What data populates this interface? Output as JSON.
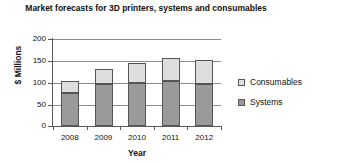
{
  "chart_data": {
    "type": "bar",
    "subtype": "stacked-bar",
    "title": "Market forecasts for 3D printers, systems and consumables",
    "xlabel": "Year",
    "ylabel": "$ Millions",
    "categories": [
      "2008",
      "2009",
      "2010",
      "2011",
      "2012"
    ],
    "series": [
      {
        "name": "Systems",
        "values": [
          77,
          96,
          99,
          103,
          96
        ],
        "color": "#9a9a9a"
      },
      {
        "name": "Consumables",
        "values": [
          26,
          36,
          45,
          54,
          56
        ],
        "color": "#dedede"
      }
    ],
    "totals": [
      103,
      132,
      144,
      157,
      152
    ],
    "ylim": [
      0,
      200
    ],
    "ytick_labels": [
      "200",
      "150",
      "100",
      "50",
      "0"
    ],
    "ytick_values": [
      200,
      150,
      100,
      50,
      0
    ],
    "ytick_interval": 50,
    "grid": "horizontal",
    "legend_position": "right",
    "legend_entries": [
      "Consumables",
      "Systems"
    ],
    "stack_order_bottom_to_top": [
      "Systems",
      "Consumables"
    ]
  }
}
